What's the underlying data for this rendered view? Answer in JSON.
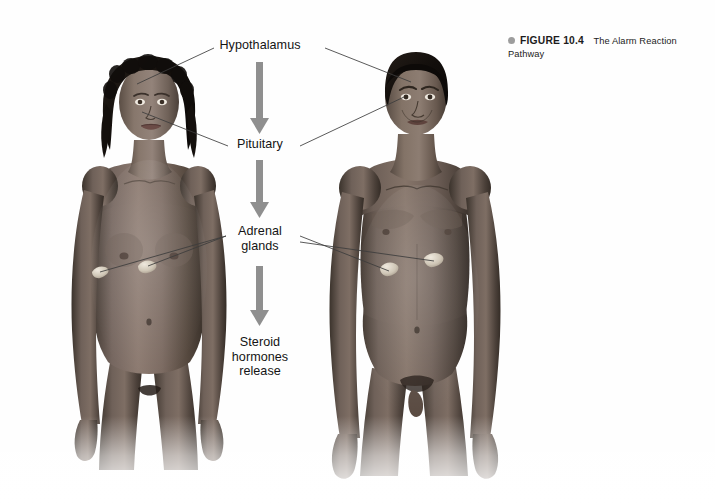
{
  "figure": {
    "caption": {
      "bullet_icon": "bullet-dot",
      "fignum": "FIGURE 10.4",
      "text": "The Alarm Reaction Pathway"
    },
    "title": "The Alarm Reaction Pathway"
  },
  "flow": {
    "steps": [
      {
        "id": "hypothalamus",
        "label": "Hypothalamus"
      },
      {
        "id": "pituitary",
        "label": "Pituitary"
      },
      {
        "id": "adrenal",
        "label": "Adrenal\nglands"
      },
      {
        "id": "steroid",
        "label": "Steroid\nhormones\nrelease"
      }
    ],
    "arrow_count": 3,
    "arrow_color": "#8f8f8f",
    "direction": "downward"
  },
  "figures": [
    {
      "id": "female-figure",
      "label": "female anatomical figure",
      "side": "left"
    },
    {
      "id": "male-figure",
      "label": "male anatomical figure",
      "side": "right"
    }
  ],
  "anatomy_markers": [
    {
      "id": "female-hypothalamus",
      "label": "hypothalamus marker"
    },
    {
      "id": "female-pituitary",
      "label": "pituitary marker"
    },
    {
      "id": "female-adrenal-left",
      "label": "adrenal gland marker"
    },
    {
      "id": "female-adrenal-right",
      "label": "adrenal gland marker"
    },
    {
      "id": "male-hypothalamus",
      "label": "hypothalamus marker"
    },
    {
      "id": "male-pituitary",
      "label": "pituitary marker"
    },
    {
      "id": "male-adrenal-left",
      "label": "adrenal gland marker"
    },
    {
      "id": "male-adrenal-right",
      "label": "adrenal gland marker"
    }
  ],
  "colors": {
    "background": "#ffffff",
    "arrow": "#8f8f8f",
    "leader_line": "#3a3a3a",
    "text": "#141414",
    "caption_bullet": "#9d9d9d",
    "skin_mid": "#6e6158",
    "skin_dark": "#3c332d",
    "hair": "#171310"
  }
}
